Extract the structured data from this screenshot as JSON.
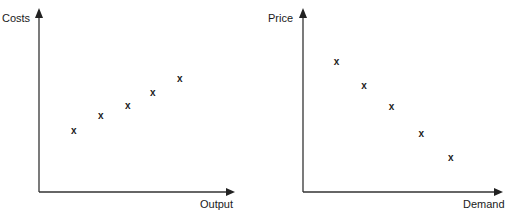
{
  "chart_data": [
    {
      "type": "scatter",
      "title": "",
      "xlabel": "Output",
      "ylabel": "Costs",
      "grid": false,
      "ticks": false,
      "marker": "x",
      "xlim": [
        0,
        10
      ],
      "ylim": [
        0,
        10
      ],
      "x": [
        1.8,
        3.2,
        4.6,
        5.9,
        7.3
      ],
      "y": [
        3.4,
        4.2,
        4.8,
        5.5,
        6.3
      ],
      "note": "No axis scale shown; values are relative positions (positive relationship)"
    },
    {
      "type": "scatter",
      "title": "",
      "xlabel": "Demand",
      "ylabel": "Price",
      "grid": false,
      "ticks": false,
      "marker": "x",
      "xlim": [
        0,
        10
      ],
      "ylim": [
        0,
        10
      ],
      "x": [
        1.7,
        3.1,
        4.5,
        6.0,
        7.5
      ],
      "y": [
        7.2,
        5.9,
        4.7,
        3.2,
        1.9
      ],
      "note": "No axis scale shown; values are relative positions (negative relationship)"
    }
  ],
  "panels": [
    {
      "ylabel": "Costs",
      "xlabel": "Output",
      "marker_glyph": "x"
    },
    {
      "ylabel": "Price",
      "xlabel": "Demand",
      "marker_glyph": "x"
    }
  ],
  "colors": {
    "axis": "#333333",
    "marker": "#222222",
    "background": "#ffffff"
  }
}
